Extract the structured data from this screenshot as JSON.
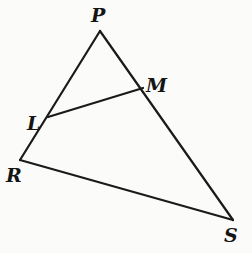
{
  "diagram": {
    "type": "triangle",
    "vertices": {
      "P": {
        "x": 100,
        "y": 31
      },
      "R": {
        "x": 20,
        "y": 160
      },
      "S": {
        "x": 233,
        "y": 220
      },
      "L": {
        "x": 48,
        "y": 117
      },
      "M": {
        "x": 143,
        "y": 88
      }
    },
    "segments": [
      {
        "name": "PR",
        "from": "P",
        "to": "R"
      },
      {
        "name": "PS",
        "from": "P",
        "to": "S"
      },
      {
        "name": "RS",
        "from": "R",
        "to": "S"
      },
      {
        "name": "LM",
        "from": "L",
        "to": "M"
      }
    ],
    "labels": [
      {
        "text": "P",
        "x": 91,
        "y": 22
      },
      {
        "text": "M",
        "x": 146,
        "y": 92
      },
      {
        "text": "L",
        "x": 27,
        "y": 130
      },
      {
        "text": "R",
        "x": 6,
        "y": 182
      },
      {
        "text": "S",
        "x": 224,
        "y": 242
      }
    ],
    "colors": {
      "stroke": "#1a1a1a",
      "background": "#fbfbf9"
    }
  }
}
